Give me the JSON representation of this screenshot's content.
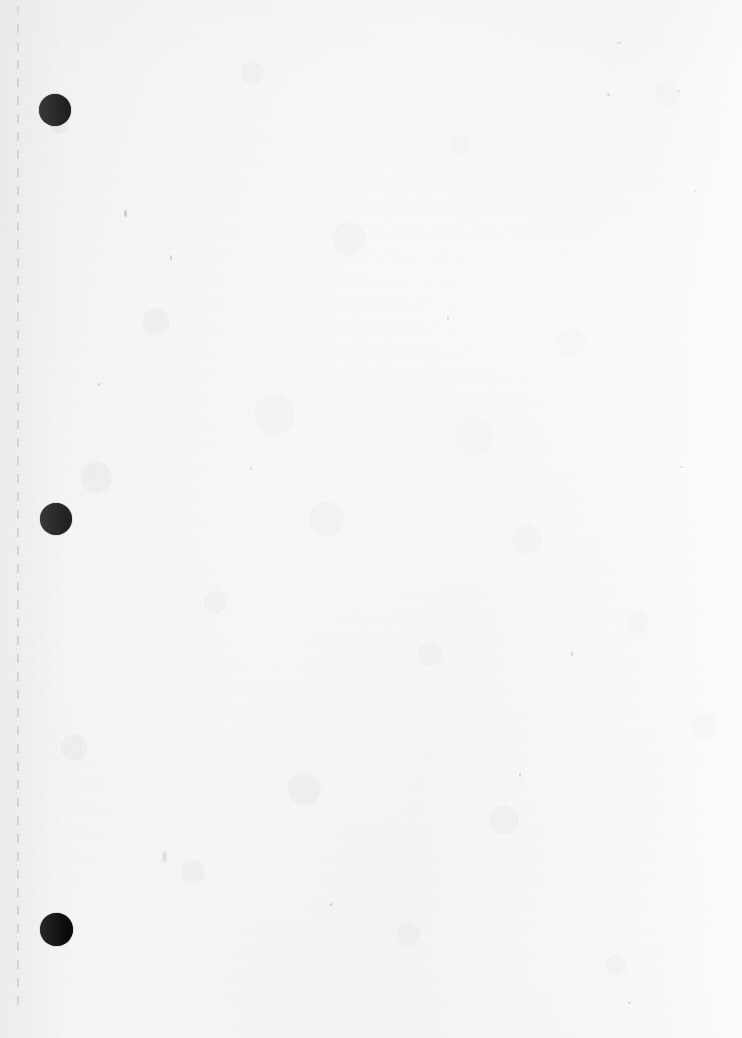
{
  "document": {
    "title": "Blank notebook page (scan)",
    "page_width": 742,
    "page_height": 1038,
    "caption": "",
    "paper_color": "#f4f4f3",
    "ink_color": "#0a0a0a",
    "perforation_color": "#a0a2a5",
    "visible_text": ""
  },
  "binding": {
    "perforation": {
      "label": "",
      "x": 17,
      "top": 6,
      "bottom": 24,
      "dash_length": 9,
      "gap_length": 9,
      "color": "#a0a2a5"
    },
    "holes": [
      {
        "label": "",
        "cx": 55,
        "cy": 110,
        "d": 32
      },
      {
        "label": "",
        "cx": 56,
        "cy": 519,
        "d": 32
      },
      {
        "label": "",
        "cx": 56,
        "cy": 929,
        "d": 33
      }
    ]
  },
  "marks": [
    {
      "label": "",
      "x": 124,
      "y": 210,
      "w": 3,
      "h": 7,
      "type": "speck"
    },
    {
      "label": "",
      "x": 163,
      "y": 851,
      "w": 3,
      "h": 11,
      "type": "smudge"
    },
    {
      "label": "",
      "x": 571,
      "y": 651,
      "w": 2,
      "h": 6,
      "type": "speck"
    },
    {
      "label": "",
      "x": 607,
      "y": 93,
      "w": 3,
      "h": 3,
      "type": "speck"
    },
    {
      "label": "",
      "x": 617,
      "y": 42,
      "w": 4,
      "h": 2,
      "type": "speck"
    },
    {
      "label": "",
      "x": 678,
      "y": 90,
      "w": 2,
      "h": 2,
      "type": "speck"
    },
    {
      "label": "",
      "x": 694,
      "y": 190,
      "w": 2,
      "h": 2,
      "type": "speck"
    },
    {
      "label": "",
      "x": 680,
      "y": 466,
      "w": 3,
      "h": 2,
      "type": "speck"
    },
    {
      "label": "",
      "x": 170,
      "y": 255,
      "w": 2,
      "h": 5,
      "type": "speck"
    },
    {
      "label": "",
      "x": 447,
      "y": 316,
      "w": 2,
      "h": 4,
      "type": "speck"
    },
    {
      "label": "",
      "x": 519,
      "y": 773,
      "w": 2,
      "h": 4,
      "type": "speck"
    },
    {
      "label": "",
      "x": 250,
      "y": 467,
      "w": 2,
      "h": 3,
      "type": "speck"
    },
    {
      "label": "",
      "x": 98,
      "y": 383,
      "w": 2,
      "h": 3,
      "type": "speck"
    },
    {
      "label": "",
      "x": 330,
      "y": 903,
      "w": 2,
      "h": 3,
      "type": "speck"
    },
    {
      "label": "",
      "x": 628,
      "y": 1002,
      "w": 3,
      "h": 2,
      "type": "speck"
    }
  ]
}
